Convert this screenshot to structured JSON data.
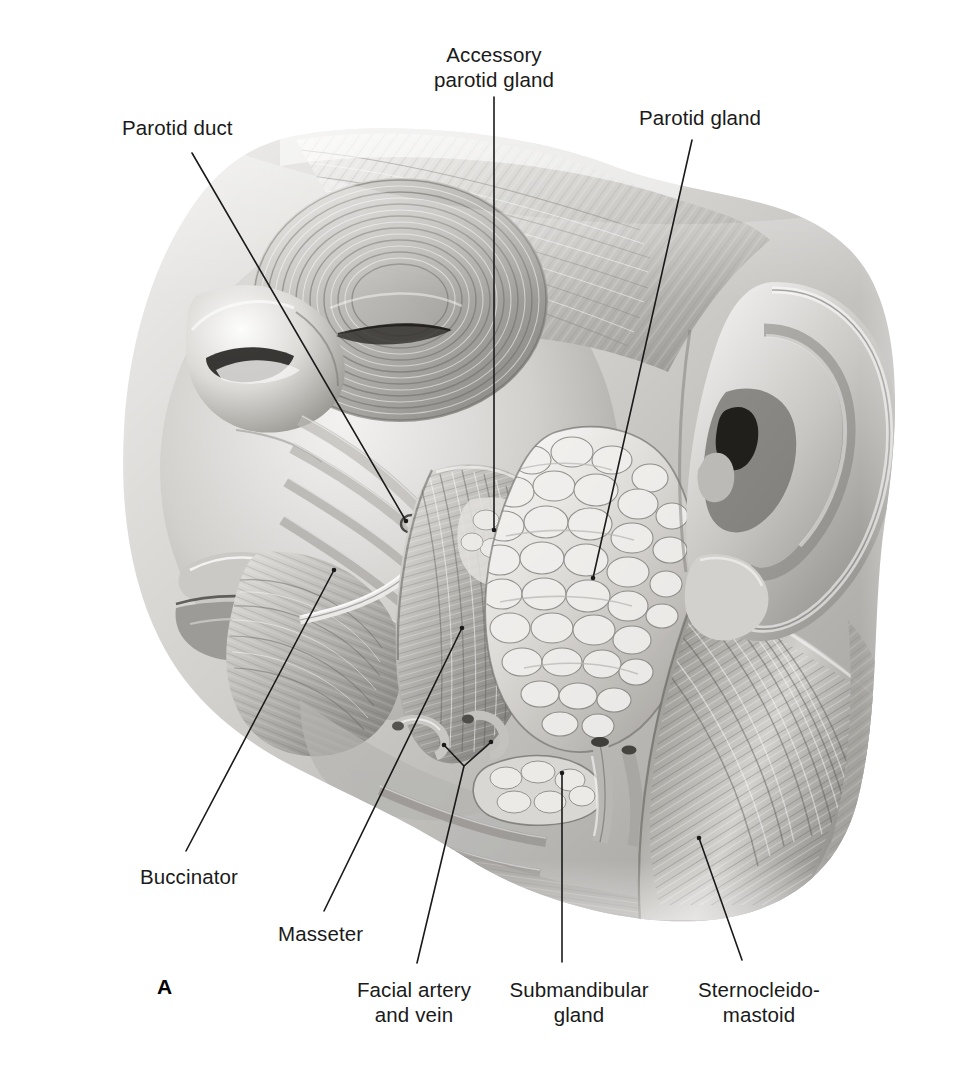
{
  "figure": {
    "letter": "A",
    "letter_pos": {
      "x": 157,
      "y": 975
    },
    "background_color": "#ffffff",
    "ink_color": "#1a1a1a",
    "illustration_type": "grayscale anatomical drawing, lateral view of the head"
  },
  "labels": [
    {
      "id": "parotid-duct",
      "text": "Parotid duct",
      "align": "left",
      "x": 122,
      "y": 115,
      "leader": [
        [
          192,
          153
        ],
        [
          406,
          521
        ]
      ]
    },
    {
      "id": "accessory-parotid-gland",
      "text": "Accessory\nparotid gland",
      "align": "center",
      "x": 494,
      "y": 42,
      "leader": [
        [
          494,
          97
        ],
        [
          494,
          530
        ]
      ]
    },
    {
      "id": "parotid-gland",
      "text": "Parotid gland",
      "align": "center",
      "x": 700,
      "y": 105,
      "leader": [
        [
          692,
          140
        ],
        [
          593,
          578
        ]
      ]
    },
    {
      "id": "buccinator",
      "text": "Buccinator",
      "align": "left",
      "x": 140,
      "y": 864,
      "leader": [
        [
          334,
          570
        ],
        [
          186,
          851
        ]
      ]
    },
    {
      "id": "masseter",
      "text": "Masseter",
      "align": "left",
      "x": 278,
      "y": 921,
      "leader": [
        [
          462,
          628
        ],
        [
          324,
          911
        ]
      ]
    },
    {
      "id": "facial-artery-and-vein",
      "text": "Facial artery\nand vein",
      "align": "center",
      "x": 414,
      "y": 977,
      "leader": [
        [
          444,
          745
        ],
        [
          464,
          766
        ],
        [
          417,
          963
        ]
      ],
      "leader_branch": [
        [
          491,
          742
        ],
        [
          464,
          766
        ]
      ]
    },
    {
      "id": "submandibular-gland",
      "text": "Submandibular\ngland",
      "align": "center",
      "x": 579,
      "y": 977,
      "leader": [
        [
          562,
          773
        ],
        [
          562,
          962
        ]
      ]
    },
    {
      "id": "sternocleidomastoid",
      "text": "Sternocleido-\nmastoid",
      "align": "center",
      "x": 759,
      "y": 977,
      "leader": [
        [
          699,
          838
        ],
        [
          742,
          960
        ]
      ]
    }
  ]
}
